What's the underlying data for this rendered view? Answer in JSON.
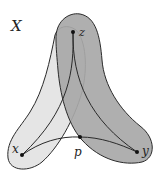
{
  "diagram": {
    "space_label": "X",
    "points": [
      {
        "id": "z",
        "label": "z",
        "x": 73,
        "y": 32
      },
      {
        "id": "x",
        "label": "x",
        "x": 22,
        "y": 155
      },
      {
        "id": "y",
        "label": "y",
        "x": 137,
        "y": 152
      },
      {
        "id": "p",
        "label": "p",
        "x": 80,
        "y": 137
      }
    ],
    "regions": [
      {
        "id": "light-region",
        "description": "neighborhood containing path z to x",
        "fill": "#e5e5e5"
      },
      {
        "id": "dark-region",
        "description": "neighborhood containing path z to y",
        "fill": "#a8a8a8"
      }
    ],
    "paths": [
      {
        "from": "z",
        "to": "x"
      },
      {
        "from": "z",
        "to": "y"
      },
      {
        "from": "x",
        "to": "y",
        "via": "p"
      }
    ],
    "colors": {
      "stroke": "#2a2a2a",
      "light_fill": "#e5e5e5",
      "dark_fill": "#a8a8a8",
      "background": "#ffffff"
    }
  }
}
